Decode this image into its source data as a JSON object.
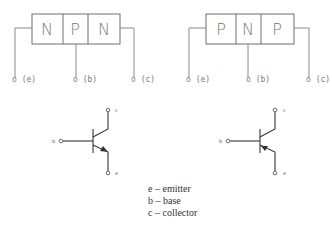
{
  "npn": {
    "regions": [
      "N",
      "P",
      "N"
    ],
    "terminals": [
      "o (e)",
      "o (b)",
      "o (c)"
    ]
  },
  "pnp": {
    "regions": [
      "P",
      "N",
      "P"
    ],
    "terminals": [
      "o (e)",
      "o (b)",
      "o (c)"
    ]
  },
  "npn_symbol": {
    "b": "b",
    "c": "c",
    "e": "e"
  },
  "pnp_symbol": {
    "b": "b",
    "c": "c",
    "e": "e"
  },
  "legend": [
    "e – emitter",
    "b – base",
    "c – collector"
  ]
}
